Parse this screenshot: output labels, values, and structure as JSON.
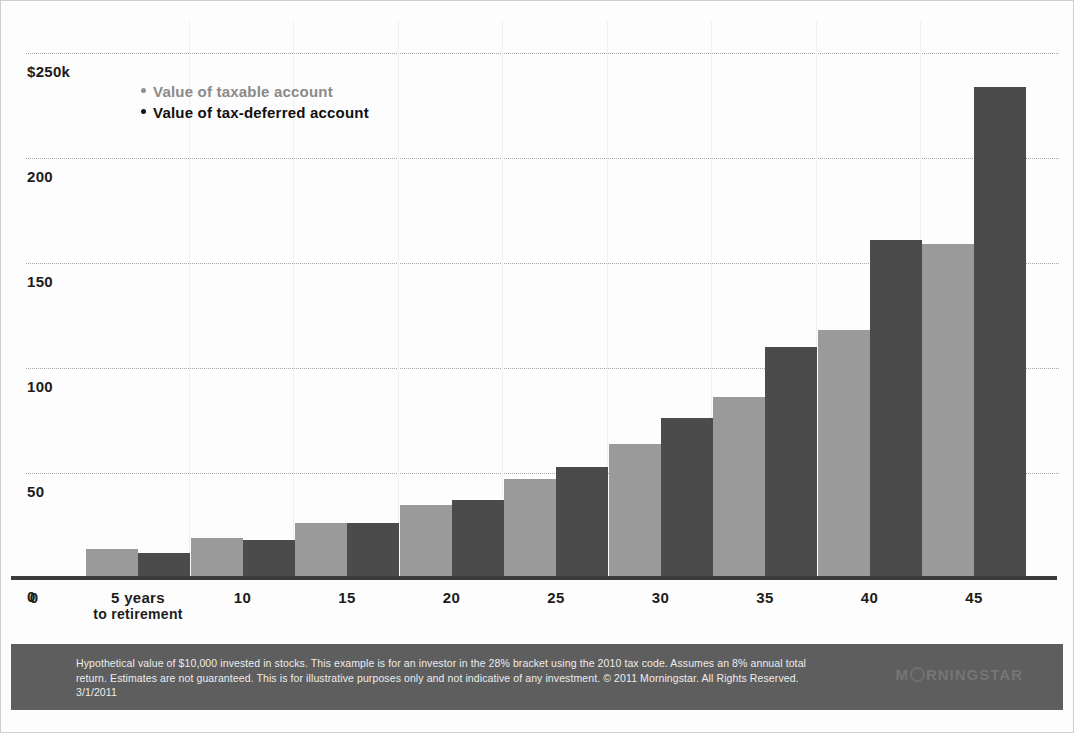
{
  "chart_data": {
    "type": "bar",
    "title": "",
    "xlabel": "",
    "ylabel": "",
    "categories": [
      "5",
      "10",
      "15",
      "20",
      "25",
      "30",
      "35",
      "40",
      "45"
    ],
    "x_tick_labels": [
      "0",
      "5 years",
      "10",
      "15",
      "20",
      "25",
      "30",
      "35",
      "40",
      "45"
    ],
    "x_tick_sublabel": "to retirement",
    "y_tick_labels": [
      "$250k",
      "200",
      "150",
      "100",
      "50",
      "0"
    ],
    "y_tick_values": [
      250,
      200,
      150,
      100,
      50,
      0
    ],
    "ylim": [
      0,
      260
    ],
    "y_unit": "thousands of dollars",
    "grid": "horizontal-dotted",
    "legend_position": "upper-left-inside",
    "series": [
      {
        "name": "Value of taxable account",
        "color": "#9a9a9a",
        "values": [
          14,
          19,
          26,
          35,
          47,
          64,
          86,
          118,
          159
        ]
      },
      {
        "name": "Value of tax-deferred account",
        "color": "#4b4b4b",
        "values": [
          12,
          18,
          26,
          37,
          53,
          76,
          110,
          161,
          234
        ]
      }
    ]
  },
  "legend": {
    "items": [
      {
        "label": "Value of taxable account",
        "marker": "bullet-dot-gray"
      },
      {
        "label": "Value of tax-deferred account",
        "marker": "bullet-dot-black"
      }
    ]
  },
  "footer": {
    "note": "Hypothetical value of $10,000 invested in stocks. This example is for an investor in the 28% bracket using the 2010 tax code. Assumes an 8% annual total return. Estimates are not guaranteed. This is for illustrative purposes only and not indicative of any investment. © 2011 Morningstar. All Rights Reserved. 3/1/2011",
    "brand": "MORNINGSTAR"
  },
  "colors": {
    "taxable": "#9a9a9a",
    "tax_deferred": "#4b4b4b",
    "footer_bg": "#5e5e5e",
    "axis": "#3b3b3b",
    "grid": "#9a9a9a"
  }
}
